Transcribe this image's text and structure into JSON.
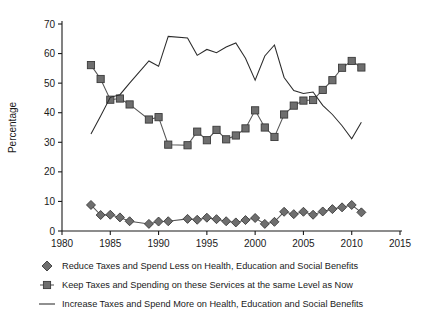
{
  "chart_data": {
    "type": "line",
    "title": "",
    "xlabel": "",
    "ylabel": "Percentage",
    "xlim": [
      1980,
      2015
    ],
    "ylim": [
      0,
      70
    ],
    "xticks": [
      1980,
      1985,
      1990,
      1995,
      2000,
      2005,
      2010,
      2015
    ],
    "yticks": [
      0,
      10,
      20,
      30,
      40,
      50,
      60,
      70
    ],
    "grid": false,
    "legend_position": "below",
    "series": [
      {
        "name": "Reduce Taxes and Spend Less on Health, Education and Social Benefits",
        "marker": "diamond",
        "x": [
          1983,
          1984,
          1985,
          1986,
          1987,
          1989,
          1990,
          1991,
          1993,
          1994,
          1995,
          1996,
          1997,
          1998,
          1999,
          2000,
          2001,
          2002,
          2003,
          2004,
          2005,
          2006,
          2007,
          2008,
          2009,
          2010,
          2011
        ],
        "values": [
          8.8,
          5.4,
          5.5,
          4.6,
          3.3,
          2.4,
          3.2,
          3.3,
          4.1,
          3.8,
          4.5,
          4.0,
          3.3,
          2.9,
          3.7,
          4.4,
          2.4,
          3.1,
          6.5,
          5.7,
          6.5,
          5.5,
          6.6,
          7.4,
          8.0,
          8.8,
          6.3
        ]
      },
      {
        "name": "Keep Taxes and Spending on these Services at the same Level as Now",
        "marker": "square",
        "x": [
          1983,
          1984,
          1985,
          1986,
          1987,
          1989,
          1990,
          1991,
          1993,
          1994,
          1995,
          1996,
          1997,
          1998,
          1999,
          2000,
          2001,
          2002,
          2003,
          2004,
          2005,
          2006,
          2007,
          2008,
          2009,
          2010,
          2011
        ],
        "values": [
          56.1,
          51.4,
          44.4,
          44.8,
          42.8,
          37.7,
          38.5,
          29.2,
          29.0,
          33.6,
          30.7,
          34.2,
          31.0,
          32.3,
          34.7,
          40.8,
          35.0,
          31.8,
          39.4,
          42.4,
          44.1,
          44.3,
          47.7,
          51.0,
          55.2,
          57.5,
          55.3
        ]
      },
      {
        "name": "Increase Taxes and Spend More on Health, Education and Social Benefits",
        "marker": "line",
        "x": [
          1983,
          1984,
          1985,
          1986,
          1987,
          1989,
          1990,
          1991,
          1993,
          1994,
          1995,
          1996,
          1997,
          1998,
          1999,
          2000,
          2001,
          2002,
          2003,
          2004,
          2005,
          2006,
          2007,
          2008,
          2009,
          2010,
          2011
        ],
        "values": [
          32.8,
          38.9,
          45.2,
          46.1,
          50.0,
          57.5,
          55.7,
          65.8,
          65.3,
          59.4,
          61.4,
          60.3,
          62.2,
          63.6,
          58.4,
          51.0,
          59.2,
          62.9,
          51.9,
          47.5,
          46.5,
          47.0,
          42.5,
          39.4,
          35.6,
          31.2,
          36.8
        ]
      }
    ]
  },
  "legend": {
    "items": [
      {
        "marker": "diamond",
        "label": "Reduce Taxes and Spend Less on Health, Education and Social Benefits"
      },
      {
        "marker": "square",
        "label": "Keep Taxes and Spending on these Services at the same Level as Now"
      },
      {
        "marker": "line",
        "label": "Increase Taxes and Spend More on Health, Education and Social Benefits"
      }
    ]
  },
  "colors": {
    "marker_fill": "#6e6e6e",
    "marker_stroke": "#3a3a3a",
    "line": "#2b2b2b",
    "axis": "#1a1a1a",
    "background": "#ffffff"
  }
}
